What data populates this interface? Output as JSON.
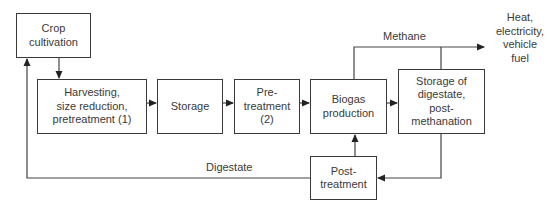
{
  "diagram": {
    "type": "process-flow",
    "nodes": [
      {
        "id": "crop",
        "label": "Crop\ncultivation"
      },
      {
        "id": "harvest",
        "label": "Harvesting,\nsize reduction,\npretreatment (1)"
      },
      {
        "id": "storage",
        "label": "Storage"
      },
      {
        "id": "pretreat",
        "label": "Pre-\ntreatment\n(2)"
      },
      {
        "id": "biogas",
        "label": "Biogas\nproduction"
      },
      {
        "id": "digest_storage",
        "label": "Storage of\ndigestate,\npost-\nmethanation"
      },
      {
        "id": "posttreat",
        "label": "Post-\ntreatment"
      }
    ],
    "edge_labels": {
      "methane": "Methane",
      "digestate": "Digestate"
    },
    "output": "Heat,\nelectricity,\nvehicle\nfuel",
    "edges": [
      {
        "from": "crop",
        "to": "harvest"
      },
      {
        "from": "harvest",
        "to": "storage"
      },
      {
        "from": "storage",
        "to": "pretreat"
      },
      {
        "from": "pretreat",
        "to": "biogas"
      },
      {
        "from": "biogas",
        "to": "digest_storage"
      },
      {
        "from": "biogas",
        "to": "output",
        "label": "Methane"
      },
      {
        "from": "digest_storage",
        "to": "output",
        "label": "Methane"
      },
      {
        "from": "digest_storage",
        "to": "posttreat"
      },
      {
        "from": "posttreat",
        "to": "biogas"
      },
      {
        "from": "posttreat",
        "to": "crop",
        "label": "Digestate"
      }
    ]
  }
}
